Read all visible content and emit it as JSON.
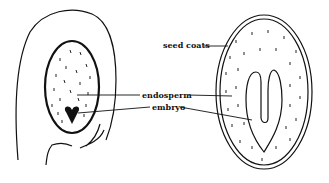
{
  "diagram": {
    "labels": {
      "seed_coats": "seed coats",
      "endosperm": "endosperm",
      "embryo": "embryo"
    },
    "colors": {
      "ink": "#111111",
      "background": "#ffffff"
    }
  }
}
